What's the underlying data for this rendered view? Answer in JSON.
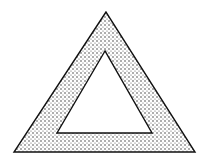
{
  "figure": {
    "background": "#ffffff",
    "stroke_color": "#111111",
    "dot_color": "#333333",
    "outer_triangle": {
      "points": "106,12 14,152 195,152"
    },
    "inner_triangle": {
      "points": "105,51 57,133 152,133"
    },
    "pattern": {
      "spacing": 4,
      "dot_radius": 0.75
    }
  }
}
